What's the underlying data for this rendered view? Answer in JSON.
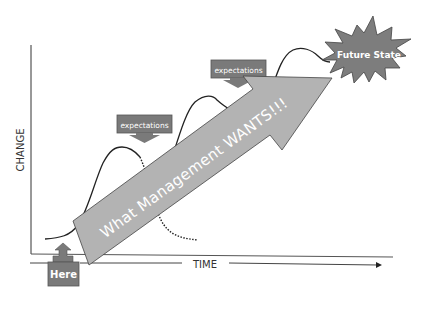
{
  "diagram": {
    "axes": {
      "y_label": "CHANGE",
      "x_label": "TIME"
    },
    "start_marker": {
      "label": "Here"
    },
    "goal_marker": {
      "label": "Future State"
    },
    "main_arrow": {
      "label": "What Management WANTS!!!"
    },
    "callouts": [
      {
        "label": "expectations"
      },
      {
        "label": "expectations"
      }
    ],
    "curves": [
      {
        "name": "first-change-curve-solid",
        "style": "solid"
      },
      {
        "name": "first-change-curve-dropoff",
        "style": "dotted"
      },
      {
        "name": "second-change-curve",
        "style": "solid"
      },
      {
        "name": "third-change-curve",
        "style": "solid"
      }
    ],
    "colors": {
      "arrow_fill": "#b3b3b3",
      "box_fill": "#7a7a7a",
      "starburst_fill": "#7d7d7d",
      "line": "#222222",
      "text_light": "#ffffff",
      "text_dark": "#333333"
    }
  }
}
